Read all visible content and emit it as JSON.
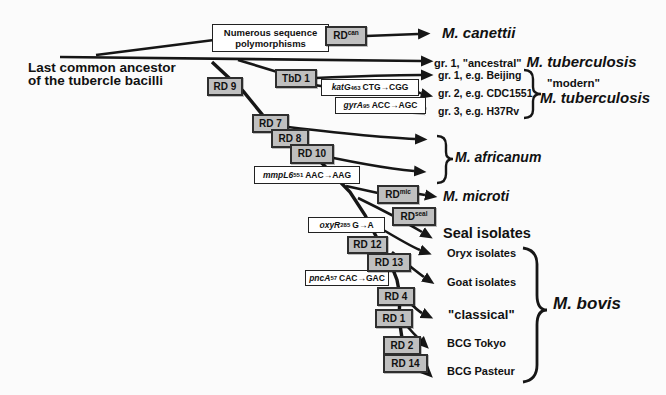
{
  "labels": {
    "ancestor_line1": "Last common ancestor",
    "ancestor_line2": "of the tubercle bacilli"
  },
  "boxes": {
    "polymorphisms_line1": "Numerous sequence",
    "polymorphisms_line2": "polymorphisms",
    "rdcan": {
      "base": "RD",
      "sup": "can"
    },
    "tbd1": "TbD 1",
    "rd9": "RD 9",
    "rd7": "RD 7",
    "rd8": "RD 8",
    "rd10": "RD 10",
    "rdmic": {
      "base": "RD",
      "sup": "mic"
    },
    "rdseal": {
      "base": "RD",
      "sup": "seal"
    },
    "rd12": "RD 12",
    "rd13": "RD 13",
    "rd4": "RD 4",
    "rd1": "RD 1",
    "rd2": "RD 2",
    "rd14": "RD 14"
  },
  "mutations": {
    "katg": {
      "gene": "katG",
      "codon": "463",
      "change": "CTG→CGG"
    },
    "gyra": {
      "gene": "gyrA",
      "codon": "95",
      "change": "ACC→AGC"
    },
    "mmpl6": {
      "gene": "mmpL6",
      "codon": "551",
      "change": "AAC→AAG"
    },
    "oxyr": {
      "gene": "oxyR",
      "codon": "285",
      "change": "G→A"
    },
    "pnca": {
      "gene": "pncA",
      "codon": "57",
      "change": "CAC→GAC"
    }
  },
  "taxa": {
    "canettii": "M. canettii",
    "ancestral_prefix": "gr. 1, \"ancestral\"",
    "ancestral_species": "M. tuberculosis",
    "gr1_beijing": "gr. 1, e.g. Beijing",
    "gr2_cdc1551": "gr. 2, e.g. CDC1551",
    "gr3_h37rv": "gr. 3, e.g. H37Rv",
    "modern_label": "\"modern\"",
    "modern_species": "M. tuberculosis",
    "africanum": "M. africanum",
    "microti": "M. microti",
    "seal": "Seal isolates",
    "oryx": "Oryx isolates",
    "goat": "Goat isolates",
    "classical": "\"classical\"",
    "bcg_tokyo": "BCG Tokyo",
    "bcg_pasteur": "BCG Pasteur",
    "bovis": "M. bovis"
  },
  "colors": {
    "box_fill": "#bfbfbf",
    "box_border": "#2e2e2e",
    "line": "#161616",
    "gray_arrow": "#9b9b9b",
    "background": "#fbfbfb"
  }
}
